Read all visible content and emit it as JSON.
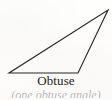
{
  "figure": {
    "kind": "geometry-illustration",
    "background_color": "#fdfdfc",
    "ink_color": "#2b2725",
    "caption": {
      "primary": "Obtuse",
      "secondary": "(one obtuse angle)",
      "secondary_clipped": true
    },
    "shape": {
      "type": "triangle",
      "stroke_color": "#2b2725",
      "stroke_width": 1.15,
      "fill": "none",
      "vertices": [
        {
          "name": "left-vertex",
          "x": 9,
          "y": 73
        },
        {
          "name": "bottom-right-vertex",
          "x": 78,
          "y": 73
        },
        {
          "name": "apex-vertex",
          "x": 108,
          "y": 10
        }
      ],
      "edges": [
        {
          "name": "base-edge",
          "from": "left-vertex",
          "to": "bottom-right-vertex"
        },
        {
          "name": "right-edge",
          "from": "bottom-right-vertex",
          "to": "apex-vertex"
        },
        {
          "name": "long-edge",
          "from": "apex-vertex",
          "to": "left-vertex"
        }
      ]
    }
  }
}
